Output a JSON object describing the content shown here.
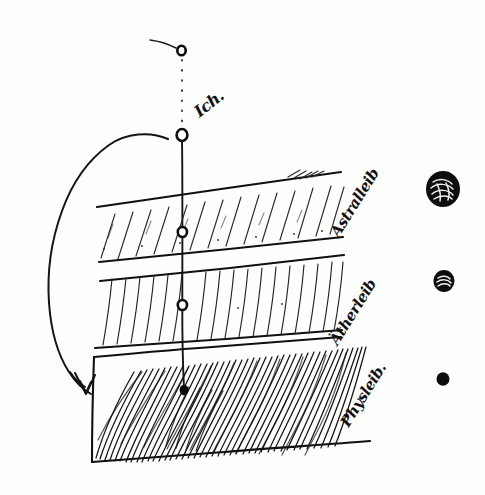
{
  "document": {
    "title": "Ich und die Leiber",
    "medium": "ink-on-paper-sketch",
    "background_color": "#fefefe",
    "ink_color": "#111111"
  },
  "axis": {
    "top_node_label": "Ich.",
    "dotted_segment": "dotted",
    "solid_segment": "solid"
  },
  "layers": [
    {
      "id": "astralleib",
      "label": "Astralleib",
      "hatch": "sparse-diagonal",
      "order": 1
    },
    {
      "id": "aetherleib",
      "label": "Ätherleib",
      "hatch": "medium-steep",
      "order": 2
    },
    {
      "id": "physleib",
      "label": "Physleib.",
      "hatch": "dense-curved",
      "order": 3
    }
  ],
  "orbs": [
    {
      "id": "orb-large",
      "style": "scribbled-filled",
      "size": "large"
    },
    {
      "id": "orb-medium",
      "style": "hatched-filled",
      "size": "medium"
    },
    {
      "id": "orb-small",
      "style": "solid-filled",
      "size": "small"
    }
  ],
  "annotations": {
    "sweep_arrow": "curved-arrow-left",
    "top_marker": "small-open-circle"
  }
}
